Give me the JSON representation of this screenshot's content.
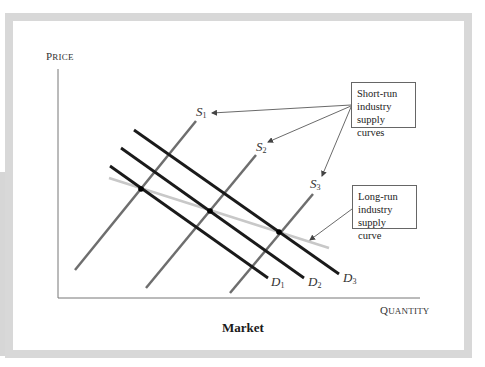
{
  "figure": {
    "caption": "Market",
    "axes": {
      "y_label_first": "P",
      "y_label_rest": "RICE",
      "x_label_first": "Q",
      "x_label_rest": "UANTITY"
    },
    "callouts": {
      "short_run": [
        "Short-run",
        "industry",
        "supply curves"
      ],
      "long_run": [
        "Long-run",
        "industry",
        "supply curve"
      ]
    },
    "curve_labels": {
      "s1": {
        "letter": "S",
        "sub": "1"
      },
      "s2": {
        "letter": "S",
        "sub": "2"
      },
      "s3": {
        "letter": "S",
        "sub": "3"
      },
      "d1": {
        "letter": "D",
        "sub": "1"
      },
      "d2": {
        "letter": "D",
        "sub": "2"
      },
      "d3": {
        "letter": "D",
        "sub": "3"
      }
    },
    "colors": {
      "frame": "#d8d8d8",
      "supply": "#6e6e6e",
      "demand": "#1a1a1a",
      "long_run": "#c8c8c8",
      "axis": "#777777"
    }
  }
}
